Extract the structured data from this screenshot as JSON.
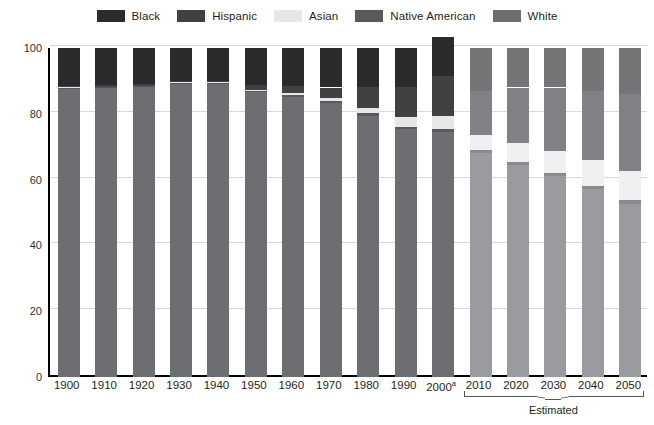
{
  "chart_data": {
    "type": "bar",
    "subtype": "stacked-column-100",
    "title": "",
    "xlabel": "",
    "ylabel": "Percentage",
    "ylim": [
      0,
      100
    ],
    "yticks": [
      0,
      20,
      40,
      60,
      80,
      100
    ],
    "grid": true,
    "legend_position": "top-center",
    "categories": [
      "1900",
      "1910",
      "1920",
      "1930",
      "1940",
      "1950",
      "1960",
      "1970",
      "1980",
      "1990",
      "2000",
      "2010",
      "2020",
      "2030",
      "2040",
      "2050"
    ],
    "category_labels": [
      "1900",
      "1910",
      "1920",
      "1930",
      "1940",
      "1950",
      "1960",
      "1970",
      "1980",
      "1990",
      "2000",
      "2010",
      "2020",
      "2030",
      "2040",
      "2050"
    ],
    "category_superscripts": [
      "",
      "",
      "",
      "",
      "",
      "",
      "",
      "",
      "",
      "",
      "a",
      "",
      "",
      "",
      "",
      ""
    ],
    "estimated_categories": [
      "2010",
      "2020",
      "2030",
      "2040",
      "2050"
    ],
    "estimated_note": "Estimated",
    "stack_order_bottom_to_top": [
      "White",
      "Native American",
      "Asian",
      "Hispanic",
      "Black"
    ],
    "series": [
      {
        "name": "White",
        "color": "#6d6e71",
        "color_estimated": "#9a9b9e",
        "values": [
          87.5,
          87.7,
          88.0,
          89.0,
          89.0,
          86.6,
          85.1,
          83.4,
          79.4,
          75.3,
          74.5,
          68.0,
          64.5,
          61.0,
          57.0,
          52.5
        ]
      },
      {
        "name": "Native American",
        "color": "#58595b",
        "color_estimated": "#8a8b8d",
        "values": [
          0.4,
          0.4,
          0.4,
          0.4,
          0.4,
          0.4,
          0.5,
          0.5,
          0.7,
          0.8,
          0.9,
          1.0,
          1.0,
          1.1,
          1.1,
          1.2
        ]
      },
      {
        "name": "Asian",
        "color": "#e6e7e8",
        "color_estimated": "#eff0f1",
        "values": [
          0.2,
          0.2,
          0.2,
          0.2,
          0.2,
          0.3,
          0.6,
          0.9,
          1.6,
          2.9,
          3.8,
          4.5,
          5.6,
          6.7,
          7.9,
          8.8
        ]
      },
      {
        "name": "Hispanic",
        "color": "#414042",
        "color_estimated": "#808184",
        "values": [
          0.4,
          0.4,
          0.4,
          0.4,
          0.4,
          1.6,
          2.2,
          3.2,
          6.4,
          9.0,
          12.3,
          13.5,
          16.9,
          19.2,
          21.0,
          23.5
        ]
      },
      {
        "name": "Black",
        "color": "#2b2b2d",
        "color_estimated": "#747577",
        "values": [
          11.5,
          11.3,
          11.0,
          10.0,
          10.0,
          11.1,
          11.6,
          12.0,
          11.9,
          12.0,
          12.0,
          13.0,
          12.0,
          12.0,
          13.0,
          14.0
        ]
      }
    ],
    "totals": [
      100,
      100,
      100,
      100,
      100,
      100,
      100,
      100,
      100,
      100,
      103.5,
      100,
      100,
      100,
      100,
      100
    ]
  },
  "legend": {
    "items": [
      {
        "label": "Black",
        "color": "#2b2b2d"
      },
      {
        "label": "Hispanic",
        "color": "#414042"
      },
      {
        "label": "Asian",
        "color": "#e6e7e8"
      },
      {
        "label": "Native American",
        "color": "#58595b"
      },
      {
        "label": "White",
        "color": "#6d6e71"
      }
    ]
  },
  "axes": {
    "y_title": "Percentage",
    "y_ticks": [
      "0",
      "20",
      "40",
      "60",
      "80",
      "100"
    ]
  },
  "footer": {
    "estimated_label": "Estimated"
  }
}
